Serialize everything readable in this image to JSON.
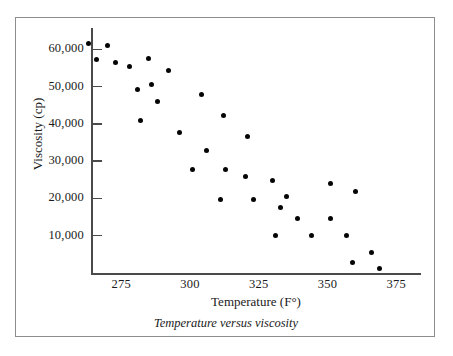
{
  "figure": {
    "caption": "Temperature versus viscosity",
    "border_color": "#8d8d8d",
    "background": "#ffffff",
    "marker_color": "#050505",
    "axis_color": "#4a4a4a"
  },
  "chart_data": {
    "type": "scatter",
    "title": "",
    "caption": "Temperature versus viscosity",
    "xlabel": "Temperature (F°)",
    "ylabel": "Viscosity (cp)",
    "xticks": [
      275,
      300,
      325,
      350,
      375
    ],
    "xtick_labels": [
      "275",
      "300",
      "325",
      "350",
      "375"
    ],
    "yticks": [
      10000,
      20000,
      30000,
      40000,
      50000,
      60000
    ],
    "ytick_labels": [
      "10,000",
      "20,000",
      "30,000",
      "40,000",
      "50,000",
      "60,000"
    ],
    "xlim": [
      264,
      384
    ],
    "ylim": [
      0,
      66000
    ],
    "grid": false,
    "legend": null,
    "series": [
      {
        "name": "viscosity",
        "marker": "filled-circle",
        "color": "#050505",
        "points": [
          {
            "x": 263,
            "y": 61700
          },
          {
            "x": 270,
            "y": 61000
          },
          {
            "x": 266,
            "y": 57400
          },
          {
            "x": 273,
            "y": 56500
          },
          {
            "x": 278,
            "y": 55400
          },
          {
            "x": 285,
            "y": 57500
          },
          {
            "x": 292,
            "y": 54300
          },
          {
            "x": 281,
            "y": 49300
          },
          {
            "x": 286,
            "y": 50500
          },
          {
            "x": 288,
            "y": 46000
          },
          {
            "x": 282,
            "y": 40800
          },
          {
            "x": 296,
            "y": 37800
          },
          {
            "x": 304,
            "y": 47900
          },
          {
            "x": 312,
            "y": 42200
          },
          {
            "x": 321,
            "y": 36600
          },
          {
            "x": 306,
            "y": 33000
          },
          {
            "x": 301,
            "y": 27900
          },
          {
            "x": 313,
            "y": 27900
          },
          {
            "x": 320,
            "y": 26000
          },
          {
            "x": 330,
            "y": 24900
          },
          {
            "x": 351,
            "y": 24000
          },
          {
            "x": 360,
            "y": 22000
          },
          {
            "x": 311,
            "y": 19600
          },
          {
            "x": 323,
            "y": 19600
          },
          {
            "x": 335,
            "y": 20400
          },
          {
            "x": 333,
            "y": 17700
          },
          {
            "x": 339,
            "y": 14500
          },
          {
            "x": 351,
            "y": 14500
          },
          {
            "x": 331,
            "y": 10000
          },
          {
            "x": 344,
            "y": 10000
          },
          {
            "x": 357,
            "y": 10000
          },
          {
            "x": 366,
            "y": 5600
          },
          {
            "x": 359,
            "y": 2700
          },
          {
            "x": 369,
            "y": 1200
          }
        ]
      }
    ]
  }
}
